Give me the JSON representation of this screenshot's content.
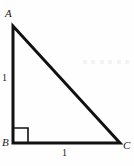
{
  "figure": {
    "kind": "right-triangle-diagram",
    "background_color": "#fefefe",
    "stroke_color": "#111111",
    "canvas": {
      "width": 134,
      "height": 166
    }
  },
  "vertices": [
    {
      "name": "A",
      "label": "A",
      "x": 13,
      "y": 26,
      "label_x": 5,
      "label_y": 8
    },
    {
      "name": "B",
      "label": "B",
      "x": 13,
      "y": 143,
      "label_x": 2,
      "label_y": 137
    },
    {
      "name": "C",
      "label": "C",
      "x": 120,
      "y": 143,
      "label_x": 123,
      "label_y": 140
    }
  ],
  "sides": [
    {
      "name": "AB",
      "label": "1",
      "orientation": "vertical",
      "label_x": 2,
      "label_y": 73
    },
    {
      "name": "BC",
      "label": "1",
      "orientation": "horizontal",
      "label_x": 62,
      "label_y": 148
    },
    {
      "name": "AC",
      "label": "",
      "orientation": "hypotenuse"
    }
  ],
  "right_angle": {
    "at_vertex": "B",
    "marker": "square",
    "x": 13,
    "y": 128,
    "size": 15
  },
  "artifact": {
    "name": "faint-dotted-row",
    "dot_count": 6,
    "color": "#f2f2f2"
  }
}
